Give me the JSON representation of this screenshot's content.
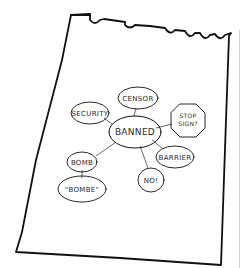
{
  "diagram": {
    "type": "mind-map",
    "medium": "hand-drawn sketch on torn notepad page",
    "center": {
      "id": "banned",
      "label": "BANNED"
    },
    "nodes": [
      {
        "id": "censor",
        "label": "CENSOR",
        "shape": "ellipse"
      },
      {
        "id": "security",
        "label": "SECURITY",
        "shape": "ellipse"
      },
      {
        "id": "stopsign",
        "label": "STOP",
        "label2": "SIGN?",
        "shape": "octagon"
      },
      {
        "id": "barrier",
        "label": "BARRIER",
        "shape": "ellipse"
      },
      {
        "id": "no",
        "label": "NO!",
        "shape": "ellipse"
      },
      {
        "id": "bomb",
        "label": "BOMB",
        "shape": "ellipse"
      },
      {
        "id": "bombe",
        "label": "\"BOMBE\"",
        "shape": "ellipse"
      }
    ],
    "edges": [
      [
        "banned",
        "censor"
      ],
      [
        "banned",
        "security"
      ],
      [
        "banned",
        "stopsign"
      ],
      [
        "banned",
        "barrier"
      ],
      [
        "banned",
        "no"
      ],
      [
        "banned",
        "bomb"
      ],
      [
        "bomb",
        "bombe"
      ]
    ]
  },
  "colors": {
    "ink": "#111111",
    "paper": "#ffffff",
    "edge": "#cfcfcf"
  }
}
